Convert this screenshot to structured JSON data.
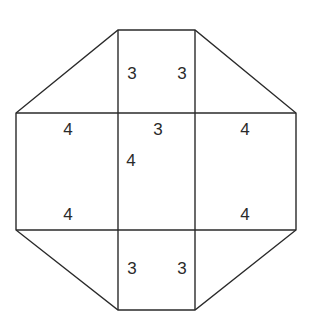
{
  "diagram": {
    "line_color": "#2a2a2a",
    "background": "#ffffff",
    "labels": [
      {
        "id": "top-left-3",
        "text": "3",
        "x": 132,
        "y": 73
      },
      {
        "id": "top-right-3",
        "text": "3",
        "x": 182,
        "y": 73
      },
      {
        "id": "left-top-4",
        "text": "4",
        "x": 68,
        "y": 129
      },
      {
        "id": "center-top-3",
        "text": "3",
        "x": 158,
        "y": 129
      },
      {
        "id": "right-top-4",
        "text": "4",
        "x": 245,
        "y": 129
      },
      {
        "id": "center-left-4",
        "text": "4",
        "x": 131,
        "y": 160
      },
      {
        "id": "left-bottom-4",
        "text": "4",
        "x": 68,
        "y": 214
      },
      {
        "id": "right-bottom-4",
        "text": "4",
        "x": 245,
        "y": 214
      },
      {
        "id": "bottom-left-3",
        "text": "3",
        "x": 132,
        "y": 268
      },
      {
        "id": "bottom-right-3",
        "text": "3",
        "x": 182,
        "y": 268
      }
    ]
  }
}
